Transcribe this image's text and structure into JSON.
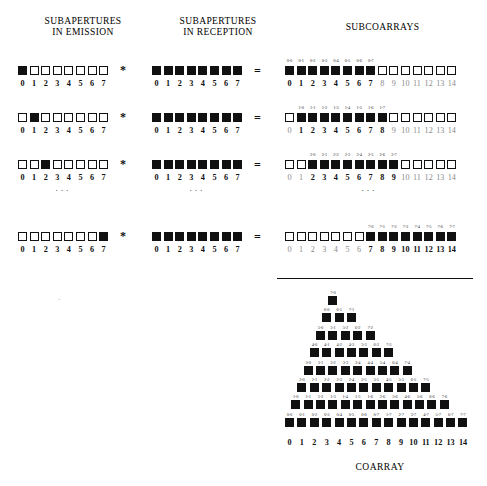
{
  "headers": {
    "emission": "SUBAPERTURES\nIN EMISSION",
    "reception": "SUBAPERTURES\nIN RECEPTION",
    "subcoarrays": "SUBCOARRAYS"
  },
  "caption": {
    "coarray": "COARRAY"
  },
  "operators": {
    "convolution": "*",
    "equals": "="
  },
  "vertical_dots": "·\n·\n·",
  "chart_data": {
    "type": "diagram",
    "emission_axis": [
      "0",
      "1",
      "2",
      "3",
      "4",
      "5",
      "6",
      "7"
    ],
    "reception_axis": [
      "0",
      "1",
      "2",
      "3",
      "4",
      "5",
      "6",
      "7"
    ],
    "subcoarray_axis": [
      "0",
      "1",
      "2",
      "3",
      "4",
      "5",
      "6",
      "7",
      "8",
      "9",
      "10",
      "11",
      "12",
      "13",
      "14"
    ],
    "coarray_axis": [
      "0",
      "1",
      "2",
      "3",
      "4",
      "5",
      "6",
      "7",
      "8",
      "9",
      "10",
      "11",
      "12",
      "13",
      "14"
    ],
    "rows": [
      {
        "emission": [
          1,
          0,
          0,
          0,
          0,
          0,
          0,
          0
        ],
        "reception": [
          1,
          1,
          1,
          1,
          1,
          1,
          1,
          1
        ],
        "subcoarray": [
          1,
          1,
          1,
          1,
          1,
          1,
          1,
          1,
          0,
          0,
          0,
          0,
          0,
          0,
          0
        ],
        "subcoarray_labels": [
          "0-0",
          "0-1",
          "0-2",
          "0-3",
          "0-4",
          "0-5",
          "0-6",
          "0-7"
        ],
        "label_offset": 0,
        "active_axis_start": 0,
        "active_axis_end": 7
      },
      {
        "emission": [
          0,
          1,
          0,
          0,
          0,
          0,
          0,
          0
        ],
        "reception": [
          1,
          1,
          1,
          1,
          1,
          1,
          1,
          1
        ],
        "subcoarray": [
          0,
          1,
          1,
          1,
          1,
          1,
          1,
          1,
          1,
          0,
          0,
          0,
          0,
          0,
          0
        ],
        "subcoarray_labels": [
          "1-0",
          "1-1",
          "1-2",
          "1-3",
          "1-4",
          "1-5",
          "1-6",
          "1-7"
        ],
        "label_offset": 1,
        "active_axis_start": 1,
        "active_axis_end": 8
      },
      {
        "emission": [
          0,
          0,
          1,
          0,
          0,
          0,
          0,
          0
        ],
        "reception": [
          1,
          1,
          1,
          1,
          1,
          1,
          1,
          1
        ],
        "subcoarray": [
          0,
          0,
          1,
          1,
          1,
          1,
          1,
          1,
          1,
          1,
          0,
          0,
          0,
          0,
          0
        ],
        "subcoarray_labels": [
          "2-0",
          "2-1",
          "2-2",
          "2-3",
          "2-4",
          "2-5",
          "2-6",
          "2-7"
        ],
        "label_offset": 2,
        "active_axis_start": 2,
        "active_axis_end": 9
      },
      {
        "emission": [
          0,
          0,
          0,
          0,
          0,
          0,
          0,
          1
        ],
        "reception": [
          1,
          1,
          1,
          1,
          1,
          1,
          1,
          1
        ],
        "subcoarray": [
          0,
          0,
          0,
          0,
          0,
          0,
          0,
          1,
          1,
          1,
          1,
          1,
          1,
          1,
          1
        ],
        "subcoarray_labels": [
          "7-0",
          "7-1",
          "7-2",
          "7-3",
          "7-4",
          "7-5",
          "7-6",
          "7-7"
        ],
        "label_offset": 7,
        "active_axis_start": 7,
        "active_axis_end": 14
      }
    ],
    "coarray_triangle": [
      {
        "indent": 7,
        "labels": [
          "7-0"
        ]
      },
      {
        "indent": 6,
        "labels": [
          "6-0",
          "6-1",
          "7-1"
        ]
      },
      {
        "indent": 5,
        "labels": [
          "5-0",
          "5-1",
          "5-2",
          "6-2",
          "7-2"
        ]
      },
      {
        "indent": 4,
        "labels": [
          "4-0",
          "4-1",
          "4-2",
          "4-3",
          "5-3",
          "6-3",
          "7-3"
        ]
      },
      {
        "indent": 3,
        "labels": [
          "3-0",
          "3-1",
          "3-2",
          "3-3",
          "3-4",
          "4-4",
          "5-4",
          "6-4",
          "7-4"
        ]
      },
      {
        "indent": 2,
        "labels": [
          "2-0",
          "2-1",
          "2-2",
          "2-3",
          "2-4",
          "2-5",
          "3-5",
          "4-5",
          "5-5",
          "6-5",
          "7-5"
        ]
      },
      {
        "indent": 1,
        "labels": [
          "1-0",
          "1-1",
          "1-2",
          "1-3",
          "1-4",
          "1-5",
          "1-6",
          "2-6",
          "3-6",
          "4-6",
          "5-6",
          "6-6",
          "7-6"
        ]
      },
      {
        "indent": 0,
        "labels": [
          "0-0",
          "0-1",
          "0-2",
          "0-3",
          "0-4",
          "0-5",
          "0-6",
          "0-7",
          "1-7",
          "2-7",
          "3-7",
          "4-7",
          "5-7",
          "6-7",
          "7-7"
        ]
      }
    ]
  }
}
